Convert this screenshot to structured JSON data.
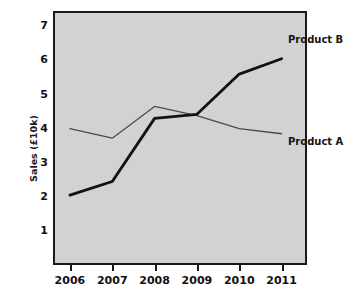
{
  "chart_data": {
    "type": "line",
    "title": "",
    "xlabel": "",
    "ylabel": "Sales (£10k)",
    "categories": [
      "2006",
      "2007",
      "2008",
      "2009",
      "2010",
      "2011"
    ],
    "x": [
      2006,
      2007,
      2008,
      2009,
      2010,
      2011
    ],
    "xlim": [
      2005.6,
      2011.6
    ],
    "ylim": [
      0,
      7.45
    ],
    "yticks": [
      1,
      2,
      3,
      4,
      5,
      6,
      7
    ],
    "ytick_labels": [
      "1",
      "2",
      "3",
      "4",
      "5",
      "6",
      "7"
    ],
    "grid": false,
    "legend_position": "inline-right-of-line-ends",
    "plot_background": "#d2d2d2",
    "series": [
      {
        "name": "Product A",
        "values": [
          4.0,
          3.72,
          4.65,
          4.38,
          4.0,
          3.85
        ],
        "color": "#4a4a4a",
        "line_width": 1.3,
        "label": "Product A"
      },
      {
        "name": "Product B",
        "values": [
          2.05,
          2.45,
          4.3,
          4.42,
          5.6,
          6.05
        ],
        "color": "#111111",
        "line_width": 2.8,
        "label": "Product B"
      }
    ]
  },
  "axes": {
    "y_title": "Sales (£10k)",
    "y_tick_labels": [
      "7",
      "6",
      "5",
      "4",
      "3",
      "2",
      "1"
    ],
    "x_tick_labels": [
      "2006",
      "2007",
      "2008",
      "2009",
      "2010",
      "2011"
    ]
  },
  "annotations": {
    "product_b_label": "Product B",
    "product_a_label": "Product A"
  }
}
